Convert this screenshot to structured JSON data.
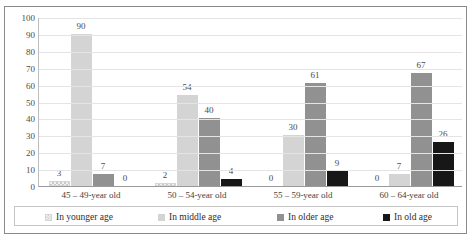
{
  "chart_data": {
    "type": "bar",
    "title": "",
    "subtitle": "",
    "xlabel": "",
    "ylabel": "",
    "ylim": [
      0,
      100
    ],
    "ytick_step": 10,
    "yticks": [
      100,
      90,
      80,
      70,
      60,
      50,
      40,
      30,
      20,
      10,
      0
    ],
    "grid": true,
    "legend_position": "bottom",
    "data_labels": true,
    "categories": [
      "45 – 49-year old",
      "50 – 54-year old",
      "55 – 59-year old",
      "60 – 64-year old"
    ],
    "series": [
      {
        "name": "In younger age",
        "color": "#f2f2f2",
        "pattern": "checkered",
        "values": [
          3,
          2,
          0,
          0
        ]
      },
      {
        "name": "In middle age",
        "color": "#d4d4d4",
        "pattern": "solid",
        "values": [
          90,
          54,
          30,
          7
        ]
      },
      {
        "name": "In older age",
        "color": "#919191",
        "pattern": "solid",
        "values": [
          7,
          40,
          61,
          67
        ]
      },
      {
        "name": "In old age",
        "color": "#171717",
        "pattern": "solid",
        "values": [
          0,
          4,
          9,
          26
        ]
      }
    ]
  },
  "legend": {
    "items": [
      {
        "label": "In younger age"
      },
      {
        "label": "In middle age"
      },
      {
        "label": "In older age"
      },
      {
        "label": "In old age"
      }
    ]
  },
  "colors": {
    "series_younger": "#f2f2f2",
    "series_middle": "#d4d4d4",
    "series_older": "#919191",
    "series_old": "#171717",
    "gridline": "#e4e4e4",
    "axis": "#9a9a9a",
    "frame_border": "#8a8a8a",
    "text": "#3f3f3f"
  }
}
